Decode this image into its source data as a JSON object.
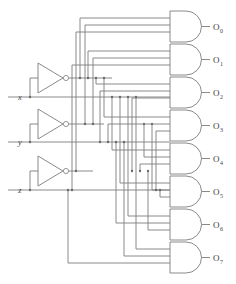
{
  "diagram": {
    "type": "logic-circuit",
    "line_color": "#7d7d7d",
    "background": "#ffffff",
    "width": 236,
    "height": 284
  },
  "inputs": [
    {
      "name": "x",
      "label": "x",
      "y": 97
    },
    {
      "name": "y",
      "label": "y",
      "y": 142
    },
    {
      "name": "z",
      "label": "z",
      "y": 190
    }
  ],
  "inverters": [
    {
      "name": "inverter-x",
      "input_label": "x",
      "output_label": "x'"
    },
    {
      "name": "inverter-y",
      "input_label": "y",
      "output_label": "y'"
    },
    {
      "name": "inverter-z",
      "input_label": "z",
      "output_label": "z'"
    }
  ],
  "gates": [
    {
      "name": "and-gate-0",
      "label": "O",
      "sub": "0",
      "minterm": "x'y'z'"
    },
    {
      "name": "and-gate-1",
      "label": "O",
      "sub": "1",
      "minterm": "x'y'z"
    },
    {
      "name": "and-gate-2",
      "label": "O",
      "sub": "2",
      "minterm": "x'yz'"
    },
    {
      "name": "and-gate-3",
      "label": "O",
      "sub": "3",
      "minterm": "x'yz"
    },
    {
      "name": "and-gate-4",
      "label": "O",
      "sub": "4",
      "minterm": "xy'z'"
    },
    {
      "name": "and-gate-5",
      "label": "O",
      "sub": "5",
      "minterm": "xy'z"
    },
    {
      "name": "and-gate-6",
      "label": "O",
      "sub": "6",
      "minterm": "xyz'"
    },
    {
      "name": "and-gate-7",
      "label": "O",
      "sub": "7",
      "minterm": "xyz"
    }
  ]
}
